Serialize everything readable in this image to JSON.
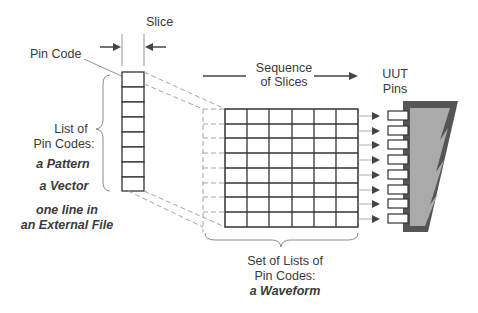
{
  "labels": {
    "slice": "Slice",
    "pin_code": "Pin Code",
    "sequence_line1": "Sequence",
    "sequence_line2": "of Slices",
    "uut_line1": "UUT",
    "uut_line2": "Pins",
    "list_line1": "List of",
    "list_line2": "Pin Codes:",
    "list_pattern": "a Pattern",
    "list_vector": "a Vector",
    "list_ext_line1": "one line in",
    "list_ext_line2": "an External File",
    "set_line1": "Set of Lists of",
    "set_line2": "Pin Codes:",
    "set_line3": "a Waveform"
  },
  "slice_column": {
    "cells": 8
  },
  "waveform_grid": {
    "columns": 6,
    "rows": 8
  },
  "uut_pins": {
    "count": 8
  },
  "colors": {
    "line": "#333333",
    "dashed": "#9a9a9a",
    "uut_dark": "#555555",
    "uut_light": "#aaaaaa",
    "text": "#3a3a3a"
  }
}
